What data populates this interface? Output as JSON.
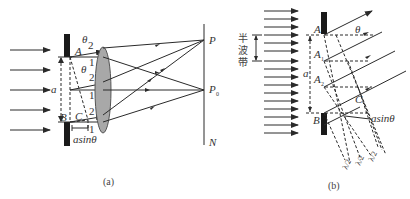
{
  "figure": {
    "panel_a": {
      "caption": "(a)",
      "labels": {
        "A": "A",
        "B": "B",
        "C": "C",
        "a": "a",
        "theta_top": "θ",
        "theta_mid": "θ",
        "asin": "asinθ",
        "P": "P",
        "P0": "P",
        "P0_sub": "0",
        "N": "N",
        "ray_labels": [
          "2",
          "1",
          "2",
          "1",
          "2",
          "1"
        ]
      },
      "elements": [
        "incident-parallel-light",
        "slit",
        "convex-lens",
        "screen"
      ]
    },
    "panel_b": {
      "caption": "(b)",
      "labels": {
        "A": "A",
        "A1": "A",
        "A1_sub": "1",
        "A2": "A",
        "A2_sub": "2",
        "B": "B",
        "C": "C",
        "a": "a",
        "theta": "θ",
        "asin": "asinθ",
        "half_wave_zone": [
          "半",
          "波",
          "带"
        ],
        "lambda_half": [
          "λ/2",
          "λ/2",
          "λ/2"
        ]
      }
    },
    "colors": {
      "line": "#2a2a2a",
      "slit": "#1a1a1a",
      "lens_fill": "#a8a8a8",
      "text": "#333333"
    }
  }
}
